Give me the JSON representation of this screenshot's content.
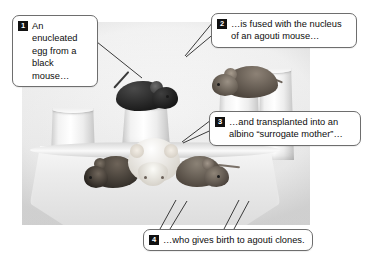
{
  "figure": {
    "photo_description": "Black-and-white photograph of a black mouse and an agouti mouse on paper-cup pedestals above an albino mouse with two agouti pups on a platform",
    "photo_alt": "mice-on-pedestals-photo"
  },
  "callouts": [
    {
      "number": "1",
      "text": "An enucleated egg from a black mouse…",
      "subject": "black-mouse"
    },
    {
      "number": "2",
      "text": "…is fused with the nucleus of an agouti mouse…",
      "subject": "agouti-mouse"
    },
    {
      "number": "3",
      "text": "…and transplanted into an albino “surrogate mother”…",
      "subject": "albino-mouse"
    },
    {
      "number": "4",
      "text": "…who gives birth to agouti clones.",
      "subject": "agouti-clone-pups"
    }
  ],
  "subjects": [
    {
      "name": "black-mouse",
      "label": "Black mouse (egg donor)"
    },
    {
      "name": "agouti-mouse",
      "label": "Agouti mouse (nucleus donor)"
    },
    {
      "name": "albino-mouse",
      "label": "Albino surrogate mother"
    },
    {
      "name": "agouti-clone-left",
      "label": "Agouti clone pup (left)"
    },
    {
      "name": "agouti-clone-right",
      "label": "Agouti clone pup (right)"
    }
  ],
  "colors": {
    "callout_border": "#6e6e6e",
    "callout_background": "#ffffff",
    "badge_background": "#111111",
    "badge_text": "#ffffff",
    "text": "#0d0d0d",
    "leader_line": "#3a3a3a",
    "page_background": "#ffffff"
  }
}
